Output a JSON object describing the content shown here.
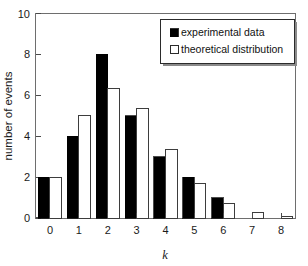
{
  "chart_data": {
    "type": "bar",
    "title": "",
    "subtitle": "",
    "xlabel": "k",
    "ylabel": "number of events",
    "categories": [
      "0",
      "1",
      "2",
      "3",
      "4",
      "5",
      "6",
      "7",
      "8"
    ],
    "x": [
      0,
      1,
      2,
      3,
      4,
      5,
      6,
      7,
      8
    ],
    "series": [
      {
        "name": "experimental data",
        "style": "filled-black",
        "color": "#000000",
        "values": [
          2,
          4,
          8,
          5,
          3,
          2,
          1,
          0,
          0
        ]
      },
      {
        "name": "theoretical distribution",
        "style": "open-white",
        "color": "#ffffff",
        "edge_color": "#3d3d3d",
        "values": [
          2.0,
          5.0,
          6.35,
          5.35,
          3.35,
          1.68,
          0.72,
          0.28,
          0.07
        ]
      }
    ],
    "xlim": [
      -0.5,
      8.5
    ],
    "ylim": [
      0,
      10
    ],
    "yticks": [
      0,
      2,
      4,
      6,
      8,
      10
    ],
    "ytick_labels": [
      "0",
      "2",
      "4",
      "6",
      "8",
      "10"
    ],
    "xticks": [
      0,
      1,
      2,
      3,
      4,
      5,
      6,
      7,
      8
    ],
    "xtick_labels": [
      "0",
      "1",
      "2",
      "3",
      "4",
      "5",
      "6",
      "7",
      "8"
    ],
    "grid": false,
    "legend_position": "top-right",
    "legend_entries": [
      "experimental data",
      "theoretical distribution"
    ],
    "frame": "box"
  },
  "axes": {
    "y_label": "number of events",
    "x_label": "k",
    "y_ticks": [
      "0",
      "2",
      "4",
      "6",
      "8",
      "10"
    ],
    "x_ticks": [
      "0",
      "1",
      "2",
      "3",
      "4",
      "5",
      "6",
      "7",
      "8"
    ]
  },
  "legend": {
    "items": [
      {
        "label": "experimental data",
        "swatch": "filled-square"
      },
      {
        "label": "theoretical distribution",
        "swatch": "open-square"
      }
    ]
  }
}
